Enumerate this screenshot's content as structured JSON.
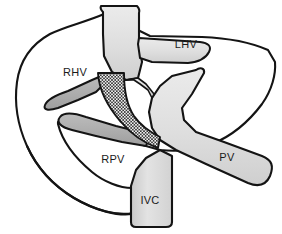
{
  "figure": {
    "type": "anatomical-diagram",
    "background_color": "#ffffff",
    "outline_color": "#141414",
    "canvas": {
      "width": 282,
      "height": 234
    }
  },
  "colors": {
    "outline": "#141414",
    "liver_parenchyma": "#ffffff",
    "portal_vein_light": "#e2e2e2",
    "portal_vein_light_2": "#d9d9d9",
    "hepatic_vein_dark": "#b2b2b2",
    "hepatic_vein_dark_2": "#a8a8a8",
    "ivc_trunk": "#dcdcdc",
    "stent_hatch_line": "#2b2b2b",
    "stent_hatch_fill": "#f0f0f0",
    "label_text": "#1a1a1a"
  },
  "structures": {
    "liver_outline": {
      "name": "liver capsule outline",
      "stroke_width": 2.1
    },
    "suprahepatic_ivc": {
      "name": "suprahepatic inferior vena cava trunk",
      "fill": "#dcdcdc"
    },
    "infrahepatic_ivc": {
      "name": "infrahepatic inferior vena cava trunk",
      "fill": "#dcdcdc"
    },
    "portal_confluence": {
      "name": "portal vein Y confluence",
      "fill": "#e2e2e2"
    },
    "shunt_tract": {
      "name": "crosshatched shunt stent tract",
      "pattern": "crosshatch",
      "hatch_spacing_px": 3.2
    }
  },
  "labels": [
    {
      "id": "lhv",
      "text": "LHV",
      "x": 186,
      "y": 48,
      "anchor": "middle",
      "name": "label-left-hepatic-vein"
    },
    {
      "id": "rhv",
      "text": "RHV",
      "x": 75,
      "y": 76,
      "anchor": "middle",
      "name": "label-right-hepatic-vein"
    },
    {
      "id": "rpv",
      "text": "RPV",
      "x": 113,
      "y": 163,
      "anchor": "middle",
      "name": "label-right-portal-vein"
    },
    {
      "id": "pv",
      "text": "PV",
      "x": 227,
      "y": 161,
      "anchor": "middle",
      "name": "label-portal-vein"
    },
    {
      "id": "ivc",
      "text": "IVC",
      "x": 150,
      "y": 204,
      "anchor": "middle",
      "name": "label-inferior-vena-cava"
    }
  ],
  "legend": {
    "abbreviations": [
      {
        "abbr": "LHV",
        "meaning": "Left hepatic vein"
      },
      {
        "abbr": "RHV",
        "meaning": "Right hepatic vein"
      },
      {
        "abbr": "RPV",
        "meaning": "Right portal vein"
      },
      {
        "abbr": "PV",
        "meaning": "Portal vein"
      },
      {
        "abbr": "IVC",
        "meaning": "Inferior vena cava"
      }
    ]
  }
}
